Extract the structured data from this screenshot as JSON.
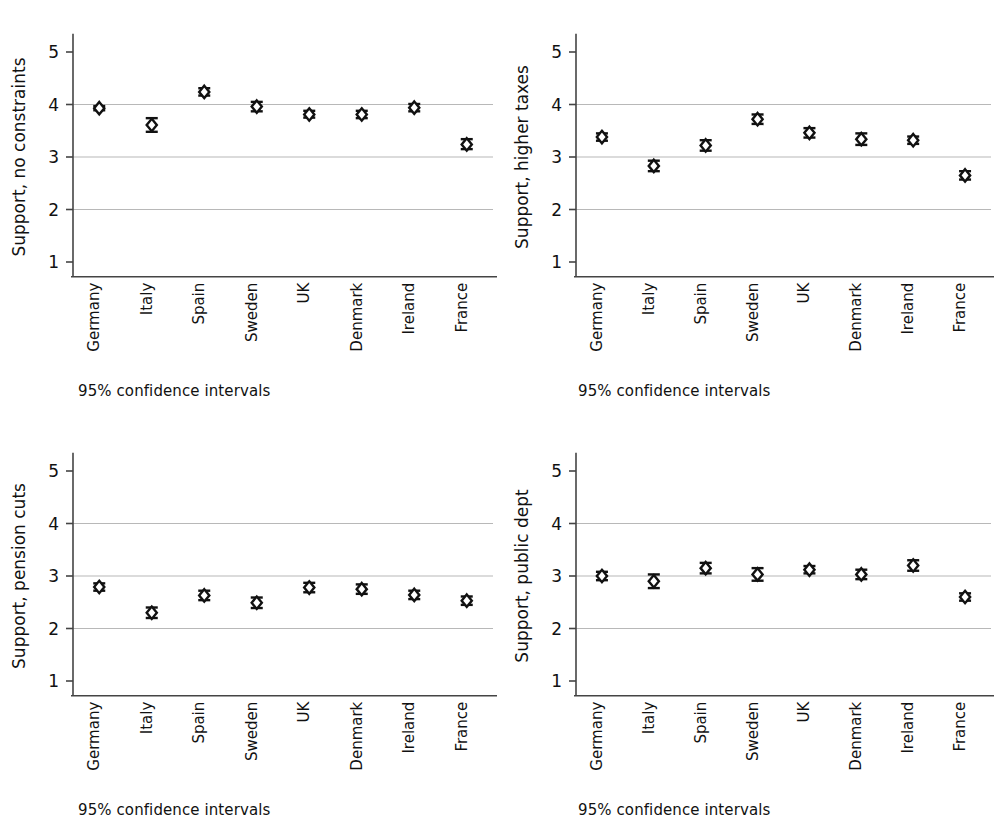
{
  "figure": {
    "panel_count": 4,
    "caption_text": "95% confidence intervals",
    "categories": [
      "Germany",
      "Italy",
      "Spain",
      "Sweden",
      "UK",
      "Denmark",
      "Ireland",
      "France"
    ],
    "y_ticks": [
      "1",
      "2",
      "3",
      "4",
      "5"
    ],
    "colors": {
      "marker": "#111111",
      "axis": "#444444",
      "grid": "#b8b8b8",
      "background": "#ffffff"
    }
  },
  "chart_data": [
    {
      "type": "scatter",
      "panel": "top-left",
      "title": "",
      "ylabel": "Support, no constraints",
      "xlabel": "",
      "annotation": "95% confidence intervals",
      "ylim": [
        0.6,
        5.4
      ],
      "yticks": [
        1,
        2,
        3,
        4,
        5
      ],
      "gridlines": [
        2,
        3,
        4
      ],
      "grid": true,
      "legend": "none",
      "categories": [
        "Germany",
        "Italy",
        "Spain",
        "Sweden",
        "UK",
        "Denmark",
        "Ireland",
        "France"
      ],
      "values": [
        3.93,
        3.61,
        4.24,
        3.96,
        3.81,
        3.81,
        3.94,
        3.24
      ],
      "ci_low": [
        3.89,
        3.48,
        4.17,
        3.87,
        3.75,
        3.74,
        3.87,
        3.15
      ],
      "ci_high": [
        3.97,
        3.74,
        4.31,
        4.05,
        3.88,
        3.88,
        4.01,
        3.34
      ]
    },
    {
      "type": "scatter",
      "panel": "top-right",
      "title": "",
      "ylabel": "Support, higher taxes",
      "xlabel": "",
      "annotation": "95% confidence intervals",
      "ylim": [
        0.6,
        5.4
      ],
      "yticks": [
        1,
        2,
        3,
        4,
        5
      ],
      "gridlines": [
        2,
        3,
        4
      ],
      "grid": true,
      "legend": "none",
      "categories": [
        "Germany",
        "Italy",
        "Spain",
        "Sweden",
        "UK",
        "Denmark",
        "Ireland",
        "France"
      ],
      "values": [
        3.38,
        2.83,
        3.22,
        3.72,
        3.46,
        3.34,
        3.32,
        2.65
      ],
      "ci_low": [
        3.31,
        2.73,
        3.12,
        3.63,
        3.37,
        3.23,
        3.25,
        2.57
      ],
      "ci_high": [
        3.45,
        2.93,
        3.32,
        3.81,
        3.55,
        3.45,
        3.39,
        2.73
      ]
    },
    {
      "type": "scatter",
      "panel": "bottom-left",
      "title": "",
      "ylabel": "Support, pension cuts",
      "xlabel": "",
      "annotation": "95% confidence intervals",
      "ylim": [
        0.6,
        5.4
      ],
      "yticks": [
        1,
        2,
        3,
        4,
        5
      ],
      "gridlines": [
        2,
        3,
        4
      ],
      "grid": true,
      "legend": "none",
      "categories": [
        "Germany",
        "Italy",
        "Spain",
        "Sweden",
        "UK",
        "Denmark",
        "Ireland",
        "France"
      ],
      "values": [
        2.79,
        2.3,
        2.63,
        2.49,
        2.78,
        2.75,
        2.64,
        2.53
      ],
      "ci_low": [
        2.72,
        2.2,
        2.54,
        2.39,
        2.69,
        2.66,
        2.56,
        2.45
      ],
      "ci_high": [
        2.86,
        2.4,
        2.72,
        2.59,
        2.87,
        2.84,
        2.72,
        2.61
      ]
    },
    {
      "type": "scatter",
      "panel": "bottom-right",
      "title": "",
      "ylabel": "Support, public dept",
      "xlabel": "",
      "annotation": "95% confidence intervals",
      "ylim": [
        0.6,
        5.4
      ],
      "yticks": [
        1,
        2,
        3,
        4,
        5
      ],
      "gridlines": [
        2,
        3,
        4
      ],
      "grid": true,
      "legend": "none",
      "categories": [
        "Germany",
        "Italy",
        "Spain",
        "Sweden",
        "UK",
        "Denmark",
        "Ireland",
        "France"
      ],
      "values": [
        3.0,
        2.9,
        3.15,
        3.03,
        3.12,
        3.03,
        3.2,
        2.6
      ],
      "ci_low": [
        2.92,
        2.77,
        3.05,
        2.91,
        3.05,
        2.94,
        3.1,
        2.53
      ],
      "ci_high": [
        3.08,
        3.03,
        3.25,
        3.15,
        3.19,
        3.12,
        3.3,
        2.67
      ]
    }
  ]
}
